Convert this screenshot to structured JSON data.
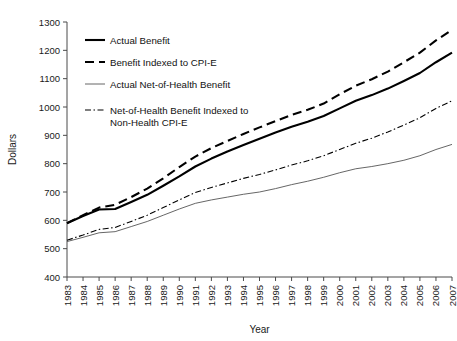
{
  "chart_data": {
    "type": "line",
    "title": "",
    "xlabel": "Year",
    "ylabel": "Dollars",
    "ylim": [
      400,
      1300
    ],
    "ytick_step": 100,
    "yticks": [
      400,
      500,
      600,
      700,
      800,
      900,
      1000,
      1100,
      1200,
      1300
    ],
    "grid": false,
    "legend_position": "top-left",
    "x": [
      1983,
      1984,
      1985,
      1986,
      1987,
      1988,
      1989,
      1990,
      1991,
      1992,
      1993,
      1994,
      1995,
      1996,
      1997,
      1998,
      1999,
      2000,
      2001,
      2002,
      2003,
      2004,
      2005,
      2006,
      2007
    ],
    "categories": [
      "1983",
      "1984",
      "1985",
      "1986",
      "1987",
      "1988",
      "1989",
      "1990",
      "1991",
      "1992",
      "1993",
      "1994",
      "1995",
      "1996",
      "1997",
      "1998",
      "1999",
      "2000",
      "2001",
      "2002",
      "2003",
      "2004",
      "2005",
      "2006",
      "2007"
    ],
    "series": [
      {
        "name": "Actual Benefit",
        "style": "solid-thick",
        "color": "#000000",
        "values": [
          590,
          615,
          638,
          640,
          665,
          690,
          722,
          755,
          790,
          818,
          843,
          866,
          888,
          910,
          930,
          948,
          968,
          995,
          1022,
          1042,
          1065,
          1092,
          1120,
          1158,
          1192
        ]
      },
      {
        "name": "Benefit Indexed to CPI-E",
        "style": "dashed-thick",
        "color": "#000000",
        "values": [
          590,
          618,
          645,
          655,
          682,
          712,
          748,
          788,
          825,
          855,
          880,
          905,
          928,
          950,
          972,
          990,
          1012,
          1045,
          1075,
          1098,
          1125,
          1158,
          1192,
          1235,
          1272
        ]
      },
      {
        "name": "Actual Net-of-Health Benefit",
        "style": "solid-thin",
        "color": "#555555",
        "values": [
          525,
          540,
          556,
          560,
          578,
          596,
          618,
          640,
          660,
          672,
          682,
          692,
          700,
          712,
          726,
          738,
          752,
          768,
          782,
          790,
          800,
          812,
          828,
          850,
          868
        ]
      },
      {
        "name": "Net-of-Health Benefit Indexed to Non-Health CPI-E",
        "style": "dash-dot",
        "color": "#000000",
        "values": [
          530,
          548,
          568,
          575,
          596,
          618,
          645,
          672,
          698,
          716,
          732,
          748,
          762,
          778,
          795,
          810,
          828,
          850,
          872,
          890,
          912,
          936,
          962,
          995,
          1022
        ]
      }
    ]
  },
  "legend": {
    "items": [
      {
        "label": "Actual Benefit"
      },
      {
        "label": "Benefit Indexed to CPI-E"
      },
      {
        "label": "Actual Net-of-Health Benefit"
      },
      {
        "label": "Net-of-Health Benefit Indexed to"
      },
      {
        "label": "Non-Health CPI-E"
      }
    ]
  }
}
